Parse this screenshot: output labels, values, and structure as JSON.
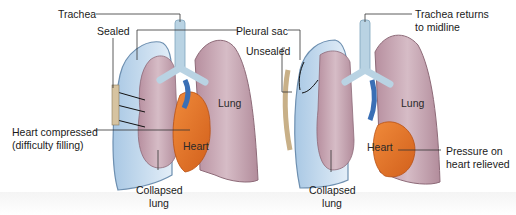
{
  "diagram": {
    "left_panel": {
      "labels": {
        "trachea": "Trachea",
        "sealed": "Sealed",
        "pleural_sac": "Pleural sac",
        "lung": "Lung",
        "heart": "Heart",
        "heart_compressed_1": "Heart compressed",
        "heart_compressed_2": "(difficulty filling)",
        "collapsed_1": "Collapsed",
        "collapsed_2": "lung"
      }
    },
    "right_panel": {
      "labels": {
        "unsealed": "Unsealed",
        "trachea_returns_1": "Trachea returns",
        "trachea_returns_2": "to midline",
        "lung": "Lung",
        "heart": "Heart",
        "pressure_1": "Pressure on",
        "pressure_2": "heart relieved",
        "collapsed_1": "Collapsed",
        "collapsed_2": "lung"
      }
    },
    "colors": {
      "pleural_space": "#cfe2f3",
      "pleural_edge": "#6d8fb0",
      "lung": "#c9a9b6",
      "lung_edge": "#8d6a78",
      "heart": "#e8742a",
      "heart_dark": "#c85a18",
      "vessel_blue": "#3a6fb5",
      "trachea": "#b9d3e3",
      "leader_line": "#333333"
    }
  }
}
